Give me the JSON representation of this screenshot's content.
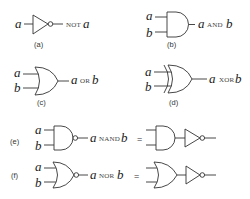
{
  "figure": {
    "panels": [
      {
        "id": "a",
        "caption": "(a)",
        "gate": "NOT",
        "inputs": [
          "a"
        ],
        "output_var1": "a",
        "operator": "NOT",
        "output_expression": "NOT a"
      },
      {
        "id": "b",
        "caption": "(b)",
        "gate": "AND",
        "inputs": [
          "a",
          "b"
        ],
        "output_var1": "a",
        "operator": "AND",
        "output_var2": "b",
        "output_expression": "a AND b"
      },
      {
        "id": "c",
        "caption": "(c)",
        "gate": "OR",
        "inputs": [
          "a",
          "b"
        ],
        "output_var1": "a",
        "operator": "OR",
        "output_var2": "b",
        "output_expression": "a OR b"
      },
      {
        "id": "d",
        "caption": "(d)",
        "gate": "XOR",
        "inputs": [
          "a",
          "b"
        ],
        "output_var1": "a",
        "operator": "XOR",
        "output_var2": "b",
        "output_expression": "a XOR b"
      },
      {
        "id": "e",
        "caption": "(e)",
        "gate": "NAND",
        "inputs": [
          "a",
          "b"
        ],
        "output_var1": "a",
        "operator": "NAND",
        "output_var2": "b",
        "output_expression": "a NAND b",
        "equals": "=",
        "equivalent": "AND followed by NOT"
      },
      {
        "id": "f",
        "caption": "(f)",
        "gate": "NOR",
        "inputs": [
          "a",
          "b"
        ],
        "output_var1": "a",
        "operator": "NOR",
        "output_var2": "b",
        "output_expression": "a NOR b",
        "equals": "=",
        "equivalent": "OR followed by NOT"
      }
    ]
  }
}
